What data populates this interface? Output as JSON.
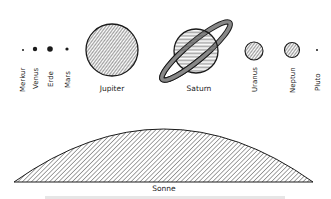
{
  "diagram": {
    "planets": [
      {
        "name": "Merkur",
        "cx": 23,
        "cy": 50,
        "r": 1,
        "label_orientation": "vertical"
      },
      {
        "name": "Venus",
        "cx": 35,
        "cy": 49,
        "r": 2.2,
        "label_orientation": "vertical"
      },
      {
        "name": "Erde",
        "cx": 50,
        "cy": 49,
        "r": 2.8,
        "label_orientation": "vertical"
      },
      {
        "name": "Mars",
        "cx": 67,
        "cy": 49,
        "r": 1.6,
        "label_orientation": "vertical"
      },
      {
        "name": "Jupiter",
        "cx": 112,
        "cy": 50,
        "r": 26,
        "label_orientation": "horizontal"
      },
      {
        "name": "Saturn",
        "cx": 196,
        "cy": 51,
        "r": 22,
        "label_orientation": "horizontal",
        "has_rings": true
      },
      {
        "name": "Uranus",
        "cx": 254,
        "cy": 51,
        "r": 9,
        "label_orientation": "vertical"
      },
      {
        "name": "Neptun",
        "cx": 292,
        "cy": 50,
        "r": 7.5,
        "label_orientation": "vertical"
      },
      {
        "name": "Pluto",
        "cx": 317,
        "cy": 50,
        "r": 1,
        "label_orientation": "vertical"
      }
    ],
    "sun": {
      "name": "Sonne",
      "shape": "arc-segment",
      "fill": "diagonal-hatch"
    }
  },
  "colors": {
    "ink": "#1a1a1a",
    "hatch": "#333333",
    "background": "#ffffff"
  }
}
